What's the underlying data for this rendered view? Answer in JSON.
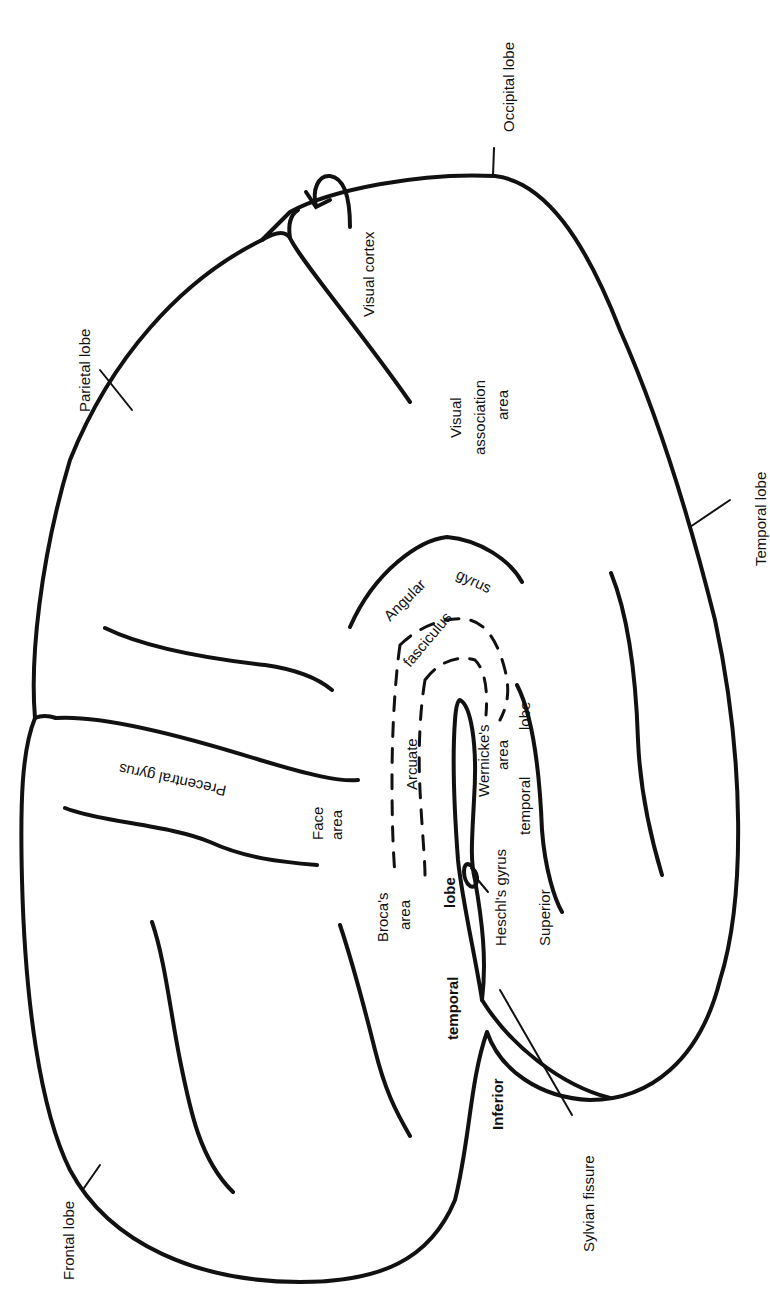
{
  "diagram": {
    "orientation": "rotated -90deg; labels read bottom-to-top",
    "colors": {
      "ink": "#111111",
      "background": "#ffffff"
    },
    "lobe_labels": {
      "occipital": "Occipital lobe",
      "parietal": "Parietal lobe",
      "temporal": "Temporal lobe",
      "frontal": "Frontal lobe"
    },
    "region_labels": {
      "visual_cortex": "Visual cortex",
      "visual_association_1": "Visual",
      "visual_association_2": "association",
      "visual_association_3": "area",
      "angular_gyrus_1": "Angular",
      "angular_gyrus_2": "gyrus",
      "arcuate": "Arcuate",
      "fasciculus": "fasciculus",
      "wernickes_1": "Wernicke's",
      "wernickes_2": "area",
      "superior_temporal_1": "Superior",
      "superior_temporal_2": "temporal",
      "superior_temporal_3": "lobe",
      "heschls_gyrus": "Heschl's gyrus",
      "face_area_1": "Face",
      "face_area_2": "area",
      "precentral_gyrus": "Precentral gyrus",
      "brocas_1": "Broca's",
      "brocas_2": "area",
      "inferior_temporal_1": "Inferior",
      "inferior_temporal_2": "temporal",
      "inferior_temporal_3": "lobe",
      "sylvian_fissure": "Sylvian fissure"
    }
  }
}
